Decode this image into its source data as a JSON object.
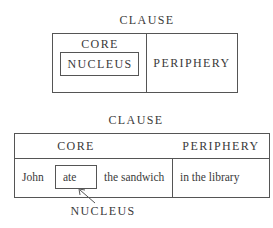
{
  "diagram_top": {
    "title": "CLAUSE",
    "core_label": "CORE",
    "nucleus_label": "NUCLEUS",
    "periphery_label": "PERIPHERY"
  },
  "diagram_bottom": {
    "title": "CLAUSE",
    "core_label": "CORE",
    "periphery_label": "PERIPHERY",
    "words": {
      "subject": "John",
      "verb": "ate",
      "object": "the sandwich",
      "adjunct": "in the library"
    },
    "nucleus_pointer_label": "NUCLEUS"
  }
}
